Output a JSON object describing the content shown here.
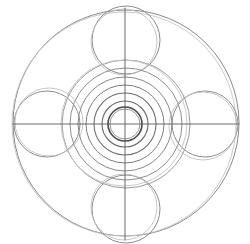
{
  "figure": {
    "title": "Concentric circle and four-petal geometric construction",
    "kind": "line-drawing",
    "medium": "pencil sketch on white paper",
    "background_color": "#ffffff",
    "canvas": {
      "width": 250,
      "height": 244
    },
    "center": {
      "x": 125,
      "y": 124
    },
    "stroke_colors": {
      "faint": "#bdbdbd",
      "light": "#a0a0a0",
      "medium": "#7a7a7a",
      "dark": "#555555",
      "darkest": "#3a3a3a"
    }
  },
  "chart_data": {
    "type": "scatter",
    "title": "Concentric circle and four-petal geometric construction",
    "xlabel": "",
    "ylabel": "",
    "xlim": [
      0,
      250
    ],
    "ylim": [
      0,
      244
    ],
    "grid": false,
    "legend": "none",
    "annotations": [
      "Large outer boundary circle",
      "Four petal circles arranged at north, east, south and west",
      "Nested concentric rings at the center",
      "Vertical and horizontal axis crosshair lines"
    ],
    "elements": [
      {
        "name": "outer-boundary-circle",
        "shape": "circle",
        "cx": 126,
        "cy": 123,
        "r": 113,
        "color": "#8a8a8a",
        "width": 1.0
      },
      {
        "name": "outer-boundary-circle-ghost",
        "shape": "circle",
        "cx": 124,
        "cy": 124,
        "r": 112,
        "color": "#c4c4c4",
        "width": 0.9
      },
      {
        "name": "petal-circle-north",
        "shape": "circle",
        "cx": 126,
        "cy": 40,
        "r": 34,
        "color": "#8c8c8c",
        "width": 1.0
      },
      {
        "name": "petal-circle-north-ghost",
        "shape": "circle",
        "cx": 124,
        "cy": 42,
        "r": 33,
        "color": "#bfbfbf",
        "width": 0.9
      },
      {
        "name": "petal-circle-east",
        "shape": "circle",
        "cx": 205,
        "cy": 124,
        "r": 33,
        "color": "#8c8c8c",
        "width": 1.0
      },
      {
        "name": "petal-circle-east-ghost",
        "shape": "circle",
        "cx": 203,
        "cy": 126,
        "r": 34,
        "color": "#bfbfbf",
        "width": 0.9
      },
      {
        "name": "petal-circle-south",
        "shape": "circle",
        "cx": 126,
        "cy": 209,
        "r": 34,
        "color": "#8c8c8c",
        "width": 1.0
      },
      {
        "name": "petal-circle-south-ghost",
        "shape": "circle",
        "cx": 124,
        "cy": 207,
        "r": 33,
        "color": "#bfbfbf",
        "width": 0.9
      },
      {
        "name": "petal-circle-west",
        "shape": "circle",
        "cx": 47,
        "cy": 124,
        "r": 33,
        "color": "#8c8c8c",
        "width": 1.0
      },
      {
        "name": "petal-circle-west-ghost",
        "shape": "circle",
        "cx": 49,
        "cy": 122,
        "r": 34,
        "color": "#bfbfbf",
        "width": 0.9
      },
      {
        "name": "concentric-ring-6",
        "shape": "circle",
        "cx": 126,
        "cy": 124,
        "r": 64,
        "color": "#9a9a9a",
        "width": 1.0
      },
      {
        "name": "concentric-ring-6-ghost",
        "shape": "circle",
        "cx": 124,
        "cy": 123,
        "r": 63,
        "color": "#c4c4c4",
        "width": 0.9
      },
      {
        "name": "concentric-ring-5",
        "shape": "circle",
        "cx": 126,
        "cy": 124,
        "r": 56,
        "color": "#8e8e8e",
        "width": 1.0
      },
      {
        "name": "concentric-ring-4",
        "shape": "circle",
        "cx": 125,
        "cy": 124,
        "r": 47,
        "color": "#8a8a8a",
        "width": 1.0
      },
      {
        "name": "concentric-ring-3",
        "shape": "circle",
        "cx": 125,
        "cy": 124,
        "r": 39,
        "color": "#7d7d7d",
        "width": 1.0
      },
      {
        "name": "concentric-ring-2",
        "shape": "circle",
        "cx": 125,
        "cy": 124,
        "r": 31,
        "color": "#6e6e6e",
        "width": 1.1
      },
      {
        "name": "concentric-ring-1",
        "shape": "circle",
        "cx": 125,
        "cy": 124,
        "r": 23,
        "color": "#6a6a6a",
        "width": 1.1
      },
      {
        "name": "concentric-ring-core",
        "shape": "circle",
        "cx": 125,
        "cy": 124,
        "r": 17,
        "color": "#4a4a4a",
        "width": 1.6
      },
      {
        "name": "concentric-ring-core-inner",
        "shape": "circle",
        "cx": 125,
        "cy": 124,
        "r": 15,
        "color": "#8a8a8a",
        "width": 0.9
      },
      {
        "name": "axis-line-horizontal",
        "shape": "line",
        "x1": 13,
        "y1": 124,
        "x2": 239,
        "y2": 124,
        "color": "#5a5a5a",
        "width": 0.9
      },
      {
        "name": "axis-line-vertical",
        "shape": "line",
        "x1": 125,
        "y1": 8,
        "x2": 125,
        "y2": 240,
        "color": "#5a5a5a",
        "width": 0.9
      }
    ]
  }
}
